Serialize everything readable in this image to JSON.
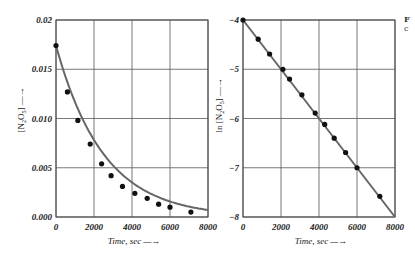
{
  "chart_data": [
    {
      "type": "scatter",
      "title": "",
      "xlabel": "Time, sec",
      "ylabel": "[N2O5]",
      "xlim": [
        0,
        8000
      ],
      "ylim": [
        0.0,
        0.02
      ],
      "grid": true,
      "x_ticks": [
        "0",
        "2000",
        "4000",
        "6000",
        "8000"
      ],
      "y_ticks": [
        "0.000",
        "0.005",
        "0.010",
        "0.015",
        "0.02"
      ],
      "fit": "exponential decay curve",
      "series": [
        {
          "name": "[N2O5] data",
          "x": [
            0,
            600,
            1150,
            1800,
            2400,
            2900,
            3500,
            4150,
            4800,
            5400,
            6000,
            7100
          ],
          "y": [
            0.0174,
            0.0127,
            0.0098,
            0.0074,
            0.0054,
            0.0042,
            0.0031,
            0.0024,
            0.0019,
            0.0013,
            0.001,
            0.0005
          ]
        }
      ]
    },
    {
      "type": "scatter",
      "title": "",
      "xlabel": "Time, sec",
      "ylabel": "ln [N2O5]",
      "xlim": [
        0,
        8000
      ],
      "ylim": [
        -8,
        -4
      ],
      "grid": true,
      "x_ticks": [
        "0",
        "2000",
        "4000",
        "6000",
        "8000"
      ],
      "y_ticks": [
        "-8",
        "-7",
        "-6",
        "-5",
        "-4"
      ],
      "fit": "straight line from (0,-4) to (8000,-8)",
      "series": [
        {
          "name": "ln[N2O5] data",
          "x": [
            0,
            800,
            1400,
            2100,
            2450,
            3100,
            3800,
            4300,
            4800,
            5400,
            6000,
            7200
          ],
          "y": [
            -4.0,
            -4.39,
            -4.69,
            -5.0,
            -5.2,
            -5.52,
            -5.89,
            -6.12,
            -6.4,
            -6.69,
            -7.0,
            -7.58
          ]
        }
      ]
    }
  ],
  "labels": {
    "left_ylabel_main": "[N",
    "left_ylabel_sub1": "2",
    "left_ylabel_mid": "O",
    "left_ylabel_sub2": "5",
    "left_ylabel_end": "]",
    "right_ylabel_prefix": "ln [N",
    "xlabel": "Time, sec"
  },
  "caption_fragment": {
    "line1": "F",
    "line2": "c"
  }
}
